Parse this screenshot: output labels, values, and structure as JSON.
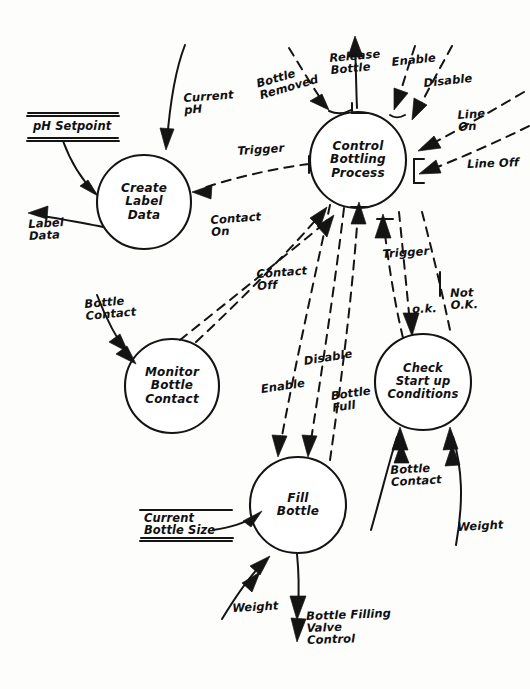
{
  "diagram": {
    "kind": "data-flow-diagram",
    "style": "hand-drawn",
    "canvas": {
      "width": 530,
      "height": 689
    },
    "ink_color": "#141414",
    "paper_color": "#fdfdfc"
  },
  "processes": [
    {
      "id": "create-label-data",
      "label": "Create\nLabel\nData",
      "cx": 144,
      "cy": 202,
      "r": 47
    },
    {
      "id": "control-bottling-process",
      "label": "Control\nBottling\nProcess",
      "cx": 358,
      "cy": 160,
      "r": 48
    },
    {
      "id": "monitor-bottle-contact",
      "label": "Monitor\nBottle\nContact",
      "cx": 172,
      "cy": 386,
      "r": 47
    },
    {
      "id": "check-startup-conditions",
      "label": "Check\nStart up\nConditions",
      "cx": 423,
      "cy": 382,
      "r": 48
    },
    {
      "id": "fill-bottle",
      "label": "Fill\nBottle",
      "cx": 298,
      "cy": 505,
      "r": 48
    }
  ],
  "stores": [
    {
      "id": "ph-setpoint",
      "label": "pH Setpoint",
      "x": 30,
      "y": 113,
      "w": 88
    },
    {
      "id": "current-bottle-size",
      "label": "Current\nBottle Size",
      "x": 142,
      "y": 510,
      "w": 90
    }
  ],
  "flows": [
    {
      "id": "current-ph",
      "label": "Current\npH",
      "lx": 183,
      "ly": 92,
      "line": "solid"
    },
    {
      "id": "label-data",
      "label": "Label\nData",
      "lx": 28,
      "ly": 218,
      "line": "solid"
    },
    {
      "id": "trigger-to-label",
      "label": "Trigger",
      "lx": 237,
      "ly": 145,
      "line": "dashed"
    },
    {
      "id": "bottle-removed",
      "label": "Bottle\nRemoved",
      "lx": 257,
      "ly": 80,
      "line": "dashed"
    },
    {
      "id": "release-bottle",
      "label": "Release\nBottle",
      "lx": 330,
      "ly": 54,
      "line": "solid"
    },
    {
      "id": "enable-in",
      "label": "Enable",
      "lx": 392,
      "ly": 58,
      "line": "dashed"
    },
    {
      "id": "disable-in",
      "label": "Disable",
      "lx": 424,
      "ly": 78,
      "line": "dashed"
    },
    {
      "id": "line-on",
      "label": "Line\nOn",
      "lx": 458,
      "ly": 110,
      "line": "dashed"
    },
    {
      "id": "line-off",
      "label": "Line Off",
      "lx": 468,
      "ly": 160,
      "line": "dashed"
    },
    {
      "id": "contact-on",
      "label": "Contact\nOn",
      "lx": 210,
      "ly": 216,
      "line": "dashed"
    },
    {
      "id": "contact-off",
      "label": "Contact\nOff",
      "lx": 256,
      "ly": 270,
      "line": "dashed"
    },
    {
      "id": "bottle-contact-monitor",
      "label": "Bottle\nContact",
      "lx": 84,
      "ly": 300,
      "line": "solid"
    },
    {
      "id": "enable-fill",
      "label": "Enable",
      "lx": 260,
      "ly": 385,
      "line": "dashed"
    },
    {
      "id": "disable-fill",
      "label": "Disable",
      "lx": 303,
      "ly": 357,
      "line": "dashed"
    },
    {
      "id": "bottle-full",
      "label": "Bottle\nFull",
      "lx": 330,
      "ly": 392,
      "line": "dashed"
    },
    {
      "id": "trigger-to-check",
      "label": "Trigger",
      "lx": 382,
      "ly": 250,
      "line": "solid"
    },
    {
      "id": "ok",
      "label": "o.k.",
      "lx": 413,
      "ly": 305,
      "line": "dashed"
    },
    {
      "id": "not-ok",
      "label": "Not\nO.K.",
      "lx": 451,
      "ly": 289,
      "line": "dashed"
    },
    {
      "id": "bottle-contact-check",
      "label": "Bottle\nContact",
      "lx": 391,
      "ly": 466,
      "line": "solid"
    },
    {
      "id": "weight-check",
      "label": "Weight",
      "lx": 458,
      "ly": 523,
      "line": "solid"
    },
    {
      "id": "weight-fill",
      "label": "Weight",
      "lx": 233,
      "ly": 604,
      "line": "solid"
    },
    {
      "id": "bottle-filling-valve",
      "label": "Bottle Filling\nValve\nControl",
      "lx": 307,
      "ly": 612,
      "line": "solid"
    }
  ]
}
